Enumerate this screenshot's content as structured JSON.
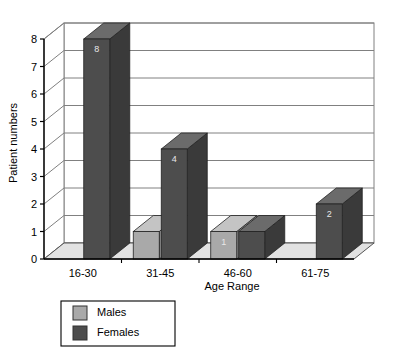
{
  "chart_data": {
    "type": "bar",
    "title": "",
    "subtitle": "",
    "xlabel": "Age Range",
    "ylabel": "Patient numbers",
    "categories": [
      "16-30",
      "31-45",
      "46-60",
      "61-75"
    ],
    "series": [
      {
        "name": "Males",
        "values": [
          0,
          1,
          1,
          0
        ],
        "color": "#a9a9a9"
      },
      {
        "name": "Females",
        "values": [
          8,
          4,
          1,
          2
        ],
        "color": "#4d4d4d"
      }
    ],
    "ylim": [
      0,
      8
    ],
    "yticks": [
      "0",
      "1",
      "2",
      "3",
      "4",
      "5",
      "6",
      "7",
      "8"
    ],
    "grid": true,
    "grid_axis": "y",
    "legend_position": "bottom-left",
    "three_d": true,
    "value_labels": {
      "Males": [
        "",
        "",
        "1",
        ""
      ],
      "Females": [
        "8",
        "4",
        "",
        "2"
      ]
    },
    "annotations": []
  },
  "legend": {
    "items": [
      {
        "label": "Males",
        "swatch": "#a9a9a9"
      },
      {
        "label": "Females",
        "swatch": "#4d4d4d"
      }
    ]
  },
  "colors": {
    "males": "#a9a9a9",
    "males_top": "#c4c4c4",
    "males_side": "#8f8f8f",
    "females": "#4d4d4d",
    "females_top": "#6b6b6b",
    "females_side": "#3a3a3a",
    "floor": "#e2e2e2",
    "floor_side": "#d0d0d0",
    "wall": "#ffffff",
    "grid": "#808080",
    "axis": "#000000",
    "label_text": "#000000",
    "value_text": "#e8e8e8"
  }
}
